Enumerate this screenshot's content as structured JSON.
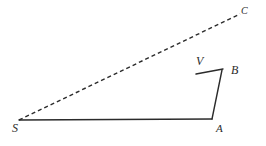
{
  "figure": {
    "width": 266,
    "height": 146,
    "background_color": "#ffffff",
    "stroke_color": "#2b2b2b",
    "label_color": "#2b2b2b",
    "type": "geometry-diagram"
  },
  "points": {
    "S": {
      "label": "S",
      "x": 19,
      "y": 120
    },
    "A": {
      "label": "A",
      "x": 212,
      "y": 119
    },
    "B": {
      "label": "B",
      "x": 222,
      "y": 70
    },
    "V": {
      "label": "V",
      "x": 197,
      "y": 73
    },
    "C": {
      "label": "C",
      "x": 240,
      "y": 14
    }
  },
  "segments": [
    {
      "name": "segment-SA",
      "from": "S",
      "to": "A",
      "style": "solid",
      "stroke_width": 1.4
    },
    {
      "name": "segment-AB",
      "from": "A",
      "to": "B",
      "style": "solid",
      "stroke_width": 1.4
    },
    {
      "name": "segment-VB",
      "from": "V",
      "to": "B",
      "style": "solid",
      "stroke_width": 1.4
    },
    {
      "name": "ray-SVC",
      "from": "S",
      "to": "C",
      "style": "dashed",
      "stroke_width": 1.4,
      "dash_pattern": "4 3"
    }
  ]
}
